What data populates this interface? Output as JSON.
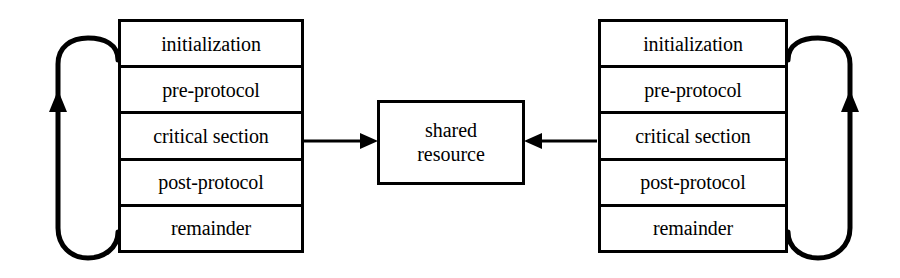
{
  "diagram": {
    "colors": {
      "stroke": "#000000",
      "background": "#ffffff",
      "text": "#000000"
    },
    "processes": [
      {
        "id": "left",
        "phases": [
          {
            "label": "initialization"
          },
          {
            "label": "pre-protocol"
          },
          {
            "label": "critical section"
          },
          {
            "label": "post-protocol"
          },
          {
            "label": "remainder"
          }
        ],
        "loop": {
          "direction": "counter-clockwise",
          "arrow": "up",
          "side": "left"
        }
      },
      {
        "id": "right",
        "phases": [
          {
            "label": "initialization"
          },
          {
            "label": "pre-protocol"
          },
          {
            "label": "critical section"
          },
          {
            "label": "post-protocol"
          },
          {
            "label": "remainder"
          }
        ],
        "loop": {
          "direction": "clockwise",
          "arrow": "up",
          "side": "right"
        }
      }
    ],
    "shared_resource": {
      "line1": "shared",
      "line2": "resource"
    },
    "connectors": [
      {
        "id": "left-to-shared",
        "from": "left.critical section",
        "to": "shared resource",
        "arrow": "right"
      },
      {
        "id": "right-to-shared",
        "from": "right.critical section",
        "to": "shared resource",
        "arrow": "left"
      }
    ]
  }
}
